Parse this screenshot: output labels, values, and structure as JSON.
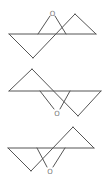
{
  "diagram": {
    "title": "",
    "line_color": "#555555",
    "label_color": "#777777",
    "structures": [
      {
        "name": "epoxide-conformer-1",
        "atom_label": "O",
        "label_pos": [
          52,
          16
        ],
        "lines": [
          [
            9,
            34,
            96,
            34
          ],
          [
            9,
            34,
            33,
            58
          ],
          [
            33,
            58,
            75,
            14
          ],
          [
            75,
            14,
            96,
            34
          ],
          [
            38,
            34,
            50,
            16
          ],
          [
            66,
            34,
            55,
            16
          ]
        ]
      },
      {
        "name": "epoxide-conformer-2",
        "atom_label": "O",
        "label_pos": [
          57,
          116
        ],
        "lines": [
          [
            9,
            91,
            101,
            91
          ],
          [
            9,
            91,
            32,
            69
          ],
          [
            32,
            69,
            78,
            116
          ],
          [
            78,
            116,
            101,
            91
          ],
          [
            40,
            91,
            54,
            110
          ],
          [
            70,
            91,
            60,
            110
          ]
        ]
      },
      {
        "name": "epoxide-conformer-3",
        "atom_label": "O",
        "label_pos": [
          50,
          174
        ],
        "lines": [
          [
            8,
            148,
            94,
            148
          ],
          [
            8,
            148,
            31,
            171
          ],
          [
            31,
            171,
            73,
            127
          ],
          [
            73,
            127,
            94,
            148
          ],
          [
            37,
            148,
            47,
            167
          ],
          [
            65,
            148,
            53,
            167
          ]
        ]
      }
    ]
  }
}
